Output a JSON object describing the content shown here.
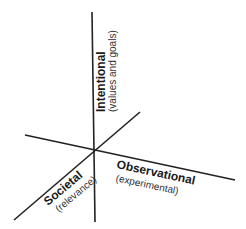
{
  "diagram": {
    "type": "three-axis",
    "line_color": "#222222",
    "center": {
      "x": 95,
      "y": 150
    },
    "axes": [
      {
        "id": "intentional",
        "label": "Intentional",
        "sublabel": "(values and goals)",
        "line": {
          "x1": 92,
          "y1": 12,
          "x2": 95,
          "y2": 222
        }
      },
      {
        "id": "observational",
        "label": "Observational",
        "sublabel": "(experimental)",
        "line": {
          "x1": 25,
          "y1": 135,
          "x2": 235,
          "y2": 180
        }
      },
      {
        "id": "societal",
        "label": "Societal",
        "sublabel": "(relevance)",
        "line": {
          "x1": 14,
          "y1": 220,
          "x2": 140,
          "y2": 112
        }
      }
    ]
  }
}
